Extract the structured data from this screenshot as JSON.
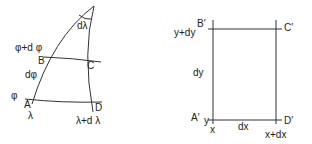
{
  "left_diagram": {
    "title": "Spherical element",
    "labels": {
      "apex_angle": "dλ",
      "lat_upper": "φ+d φ",
      "lat_lower": "φ",
      "dphi": "dφ",
      "lon_left": "λ",
      "lon_right": "λ+d λ",
      "A": "A",
      "B": "B",
      "C": "C",
      "D": "D"
    }
  },
  "right_diagram": {
    "title": "Plane element",
    "labels": {
      "A": "A′",
      "B": "B′",
      "C": "C′",
      "D": "D′",
      "y": "y",
      "y_plus": "y+dy",
      "x": "x",
      "x_plus": "x+dx",
      "dx": "dx",
      "dy": "dy"
    }
  },
  "colors": {
    "line": "#333333",
    "text": "#222222",
    "background": "#ffffff"
  }
}
